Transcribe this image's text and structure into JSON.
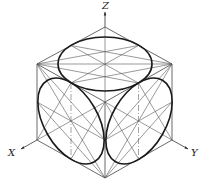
{
  "diagram": {
    "axes": {
      "x_label": "X",
      "y_label": "Y",
      "z_label": "Z"
    },
    "vertices": {
      "top": [
        105,
        27
      ],
      "upper_left": [
        37,
        64
      ],
      "upper_right": [
        172,
        64
      ],
      "lower_left": [
        37,
        140
      ],
      "lower_right": [
        172,
        140
      ],
      "bottom": [
        105,
        178
      ],
      "center": [
        105,
        102
      ]
    },
    "face_centers": {
      "top": [
        105,
        64
      ],
      "left": [
        71,
        121
      ],
      "right": [
        139,
        121
      ]
    },
    "colors": {
      "ellipse": "#1a1a1a",
      "edge": "#444444",
      "background": "#ffffff"
    }
  }
}
